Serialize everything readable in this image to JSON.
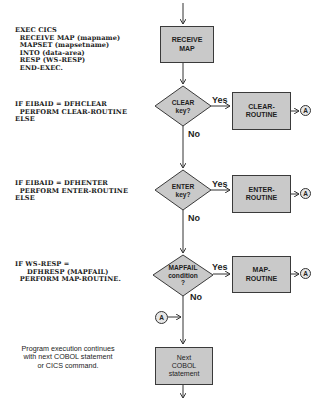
{
  "code_blocks": {
    "receive": "EXEC CICS\n  RECEIVE MAP (mapname)\n  MAPSET (mapsetname)\n  INTO (data-area)\n  RESP (WS-RESP)\n  END-EXEC.",
    "clear": "IF EIBAID = DFHCLEAR\n  PERFORM CLEAR-ROUTINE\nELSE",
    "enter": "IF EIBAID = DFHENTER\n  PERFORM ENTER-ROUTINE\nELSE",
    "mapfail": "IF WS-RESP =\n     DFHRESP (MAPFAIL)\n  PERFORM MAP-ROUTINE."
  },
  "note": "Program execution continues\nwith next COBOL statement\nor CICS command.",
  "flowchart": {
    "start_box": "RECEIVE\nMAP",
    "decisions": [
      {
        "label": "CLEAR\nkey?",
        "yes": "Yes",
        "no": "No",
        "routine": "CLEAR-\nROUTINE",
        "connector": "A"
      },
      {
        "label": "ENTER\nkey?",
        "yes": "Yes",
        "no": "No",
        "routine": "ENTER-\nROUTINE",
        "connector": "A"
      },
      {
        "label": "MAPFAIL\ncondition\n?",
        "yes": "Yes",
        "no": "No",
        "routine": "MAP-\nROUTINE",
        "connector": "A"
      }
    ],
    "merge_connector": "A",
    "end_box": "Next\nCOBOL\nstatement"
  },
  "colors": {
    "box_fill": "#c9c9c9",
    "line": "#333333",
    "background": "#ffffff"
  }
}
